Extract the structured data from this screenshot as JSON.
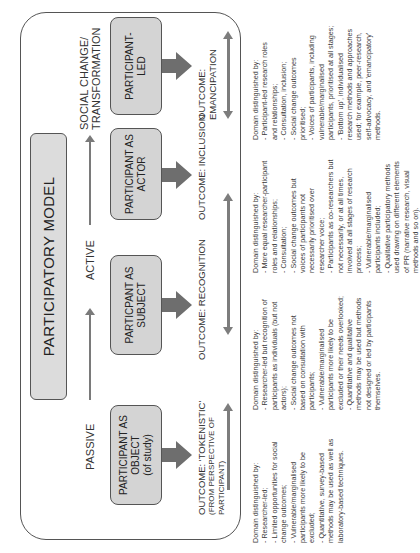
{
  "title": "PARTICIPATORY MODEL",
  "orientation": "rotated 90° counter-clockwise",
  "stages": [
    {
      "label": "PASSIVE"
    },
    {
      "label": "ACTIVE"
    },
    {
      "label_line1": "SOCIAL CHANGE/",
      "label_line2": "TRANSFORMATION"
    }
  ],
  "nodes": [
    {
      "line1": "PARTICIPANT AS",
      "line2": "OBJECT",
      "line3": "(of study)",
      "outcome": "OUTCOME: 'TOKENISTIC'",
      "outcome_sub1": "(FROM PERSPECTIVE OF",
      "outcome_sub2": "PARTICIPANT)"
    },
    {
      "line1": "PARTICPANT AS",
      "line2": "SUBJECT",
      "outcome": "OUTCOME: RECOGNITION"
    },
    {
      "line1": "PARTICIPANT AS",
      "line2": "ACTOR",
      "outcome": "OUTCOME: INCLUSION"
    },
    {
      "line1": "PARTICIPANT-",
      "line2": "LED",
      "outcome": "OUTCOME: EMANCIPATION"
    }
  ],
  "colors": {
    "node_fill": "#d4d4d4",
    "title_fill": "#dcdcdc",
    "border": "#555555",
    "arrow": "#7a7a7a"
  },
  "descriptions": [
    {
      "lines": [
        "Domain distinguished by:",
        "- Researcher-led;",
        "- Limited opportunities for social",
        "  change  outcomes;",
        "- Vulnerable/marginalised",
        "  participants more likely to be",
        "  excluded;",
        "- Quantitative, survey-based",
        "  methods may be used as well as",
        "  laboratory-based techniques."
      ]
    },
    {
      "lines": [
        "Domain distinguished by:",
        "- Researcher-led but recognition of",
        "participants as individuals (but not",
        "actors);",
        "- Social change outcomes not",
        "based on consultation with",
        "participants;",
        "- Vulnerable/marginalised",
        "participants more likely to be",
        "excluded or their needs overlooked;",
        "- Quantitative and qualitative",
        "methods may be used but methods",
        "not designed or led by participants",
        "themselves."
      ]
    },
    {
      "lines": [
        "Domain distinguished by:",
        "- More equal researcher-participant",
        "roles and relationships;",
        "- Consultation;",
        "- Social change outcomes but",
        "voices of participants not",
        "necessarily prioritised over",
        "researcher voice;",
        "- Participants as co-researchers but",
        "not necessarily, or at all times,",
        "involved at all stages of research",
        "process;",
        "- Vulnerable/marginalised",
        "participants included;",
        "- Qualitative participatory methods",
        "used drawing on different elements",
        "of PR (narrative research, visual",
        "methods and so on)."
      ]
    },
    {
      "lines": [
        "Domain distinguished by:",
        "- Participant-led research roles",
        "  and relationships;",
        "- Consultation, inclusion;",
        "- Social change outcomes",
        "prioritised;",
        "- Voices of participants, including",
        "vulnerable/marginalised",
        "participants, prioritised at all stages;",
        "- 'Bottom up', individualised",
        "research methods and approaches",
        "used; for example, peer-research,",
        "self-advocacy, and 'emancipatory'",
        "methods."
      ]
    }
  ]
}
